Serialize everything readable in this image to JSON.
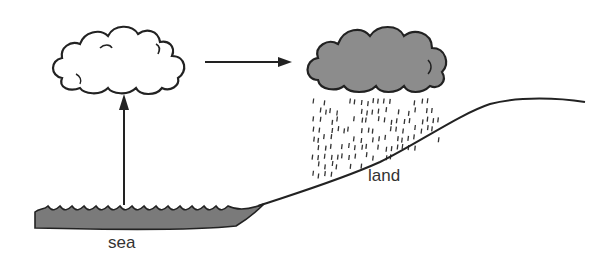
{
  "diagram": {
    "type": "water-cycle",
    "labels": {
      "sea": "sea",
      "land": "land"
    },
    "elements": [
      {
        "id": "white-cloud",
        "description": "cloud forming over the sea (evaporation)"
      },
      {
        "id": "rain-cloud",
        "description": "grey rain cloud over land"
      },
      {
        "id": "evaporation-arrow",
        "description": "upward arrow from sea to cloud"
      },
      {
        "id": "wind-arrow",
        "description": "arrow moving cloud toward land"
      },
      {
        "id": "rain",
        "description": "rain falling from grey cloud onto land"
      },
      {
        "id": "sea",
        "description": "wavy grey sea surface"
      },
      {
        "id": "land",
        "description": "rising land slope"
      }
    ],
    "colors": {
      "stroke": "#222222",
      "rain_cloud_fill": "#8c8c8c",
      "sea_fill": "#7a7a7a",
      "white_cloud_fill": "#ffffff"
    }
  }
}
